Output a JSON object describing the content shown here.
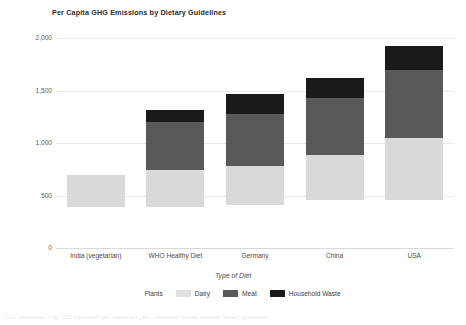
{
  "chart_data": {
    "type": "bar",
    "subtype": "stacked-bar",
    "title": "Per Capita GHG Emissions by Dietary Guidelines",
    "xlabel": "Type of Diet",
    "ylabel": "",
    "categories": [
      "India (vegetarian)",
      "WHO Healthy Diet",
      "Germany",
      "China",
      "USA"
    ],
    "ylim": [
      0,
      2000
    ],
    "ytick_labels": [
      "0",
      "500",
      "1,000",
      "1,500",
      "2,000"
    ],
    "ytick_values": [
      0,
      500,
      1000,
      1500,
      2000
    ],
    "grid": true,
    "legend_position": "bottom",
    "series": [
      {
        "name": "Plants",
        "color": "#ffffff",
        "values": [
          390,
          395,
          410,
          455,
          460
        ]
      },
      {
        "name": "Dairy",
        "color": "#d9d9d9",
        "values": [
          305,
          350,
          370,
          430,
          590
        ]
      },
      {
        "name": "Meat",
        "color": "#595959",
        "values": [
          0,
          455,
          495,
          545,
          645
        ]
      },
      {
        "name": "Household Waste",
        "color": "#1a1a1a",
        "values": [
          0,
          115,
          190,
          190,
          230
        ]
      }
    ],
    "totals": [
      695,
      1315,
      1465,
      1620,
      1925
    ]
  },
  "caption": "GHG emissions in kg CO2 equivalent per capita per year, compared across national dietary guidelines"
}
